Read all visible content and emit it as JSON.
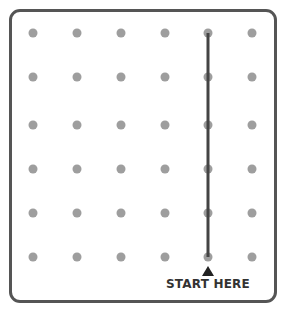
{
  "grid": {
    "columns_x": [
      33,
      77,
      121,
      165,
      208,
      252
    ],
    "rows_y": [
      33,
      77,
      125,
      169,
      213,
      257
    ],
    "dot_color": "#9e9e9e"
  },
  "path": {
    "column_index": 4,
    "from_row": 0,
    "to_row": 5,
    "color": "#444444"
  },
  "start_marker": {
    "label": "START HERE",
    "arrow": "up-triangle"
  },
  "frame": {
    "border_color": "#555555"
  }
}
